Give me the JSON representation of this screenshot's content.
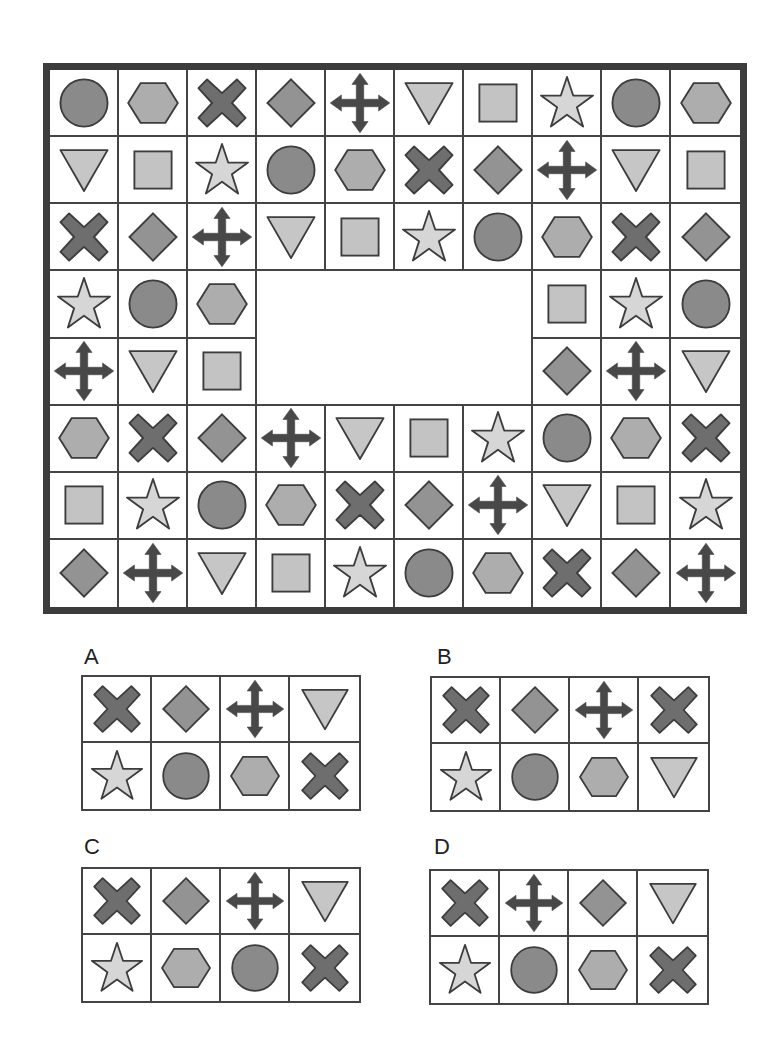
{
  "colors": {
    "frame": "#3c3c3c",
    "gridline": "#444444",
    "stroke": "#3d3d3d",
    "circle": "#8a8a8a",
    "hexagon": "#adadad",
    "cross": "#6e6e6e",
    "diamond": "#939393",
    "arrows": "#484848",
    "triangle": "#c6c6c6",
    "square": "#c3c3c3",
    "star": "#d6d6d6"
  },
  "puzzle": {
    "columns": 10,
    "rows": 8,
    "grid": [
      [
        "circle",
        "hexagon",
        "cross",
        "diamond",
        "arrows",
        "triangle",
        "square",
        "star",
        "circle",
        "hexagon"
      ],
      [
        "triangle",
        "square",
        "star",
        "circle",
        "hexagon",
        "cross",
        "diamond",
        "arrows",
        "triangle",
        "square"
      ],
      [
        "cross",
        "diamond",
        "arrows",
        "triangle",
        "square",
        "star",
        "circle",
        "hexagon",
        "cross",
        "diamond"
      ],
      [
        "star",
        "circle",
        "hexagon",
        null,
        null,
        null,
        null,
        "square",
        "star",
        "circle"
      ],
      [
        "arrows",
        "triangle",
        "square",
        null,
        null,
        null,
        null,
        "diamond",
        "arrows",
        "triangle"
      ],
      [
        "hexagon",
        "cross",
        "diamond",
        "arrows",
        "triangle",
        "square",
        "star",
        "circle",
        "hexagon",
        "cross"
      ],
      [
        "square",
        "star",
        "circle",
        "hexagon",
        "cross",
        "diamond",
        "arrows",
        "triangle",
        "square",
        "star"
      ],
      [
        "diamond",
        "arrows",
        "triangle",
        "square",
        "star",
        "circle",
        "hexagon",
        "cross",
        "diamond",
        "arrows"
      ]
    ],
    "missing_region": {
      "rows": [
        3,
        4
      ],
      "cols": [
        3,
        4,
        5,
        6
      ]
    }
  },
  "options": [
    {
      "label": "A",
      "cells": [
        [
          "cross",
          "diamond",
          "arrows",
          "triangle"
        ],
        [
          "star",
          "circle",
          "hexagon",
          "cross"
        ]
      ]
    },
    {
      "label": "B",
      "cells": [
        [
          "cross",
          "diamond",
          "arrows",
          "cross"
        ],
        [
          "star",
          "circle",
          "hexagon",
          "triangle"
        ]
      ]
    },
    {
      "label": "C",
      "cells": [
        [
          "cross",
          "diamond",
          "arrows",
          "triangle"
        ],
        [
          "star",
          "hexagon",
          "circle",
          "cross"
        ]
      ]
    },
    {
      "label": "D",
      "cells": [
        [
          "cross",
          "arrows",
          "diamond",
          "triangle"
        ],
        [
          "star",
          "circle",
          "hexagon",
          "cross"
        ]
      ]
    }
  ]
}
